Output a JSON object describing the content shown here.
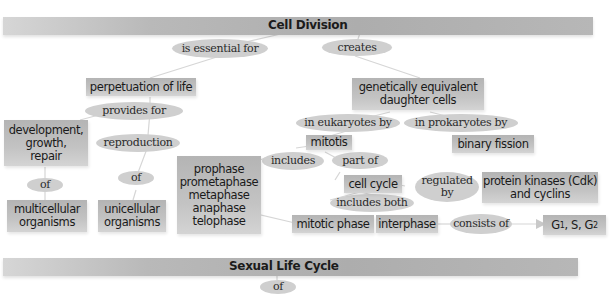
{
  "sections": {
    "cell_division": "Cell Division",
    "sexual_life_cycle": "Sexual Life Cycle"
  },
  "concepts": {
    "perpetuation": "perpetuation of life",
    "daughter_cells": "genetically equivalent\ndaughter cells",
    "development": "development,\ngrowth,\nrepair",
    "multicellular": "multicellular\norganisms",
    "unicellular": "unicellular\norganisms",
    "phases": "prophase\nprometaphase\nmetaphase\nanaphase\ntelophase",
    "mitotis": "mitotis",
    "binary_fission": "binary fission",
    "cell_cycle": "cell cycle",
    "protein_kinases": "protein kinases (Cdk)\nand cyclins",
    "mitotic_phase": "mitotic phase",
    "interphase": "interphase",
    "g_phases": {
      "g1": "G",
      "g1_sub": "1",
      "s": ", S, G",
      "g2_sub": "2"
    }
  },
  "links": {
    "is_essential_for": "is essential  for",
    "creates": "creates",
    "provides_for": "provides for",
    "reproduction": "reproduction",
    "of_left": "of",
    "of_mid": "of",
    "in_eukaryotes_by": "in eukaryotes by",
    "in_prokaryotes_by": "in prokaryotes by",
    "includes": "includes",
    "part_of": "part of",
    "regulated_by": "regulated\nby",
    "includes_both": "includes both",
    "consists_of": "consists of",
    "of_bottom": "of"
  },
  "colors": {
    "bar": "#b0b0b0",
    "concept_box": "#c0c0c0",
    "link_oval": "#cfcfcf",
    "connector": "#d9d9d9"
  }
}
